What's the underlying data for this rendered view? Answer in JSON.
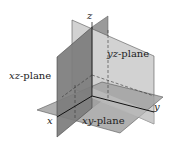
{
  "diagram": {
    "planes": [
      {
        "id": "xz",
        "label_var": "xz",
        "label_suffix": "-plane",
        "color": "#8a8a8a"
      },
      {
        "id": "yz",
        "label_var": "yz",
        "label_suffix": "-plane",
        "color": "#cfcfcf"
      },
      {
        "id": "xy",
        "label_var": "xy",
        "label_suffix": "-plane",
        "color": "#9c9c9c"
      }
    ],
    "axes": {
      "x": "x",
      "y": "y",
      "z": "z"
    }
  }
}
